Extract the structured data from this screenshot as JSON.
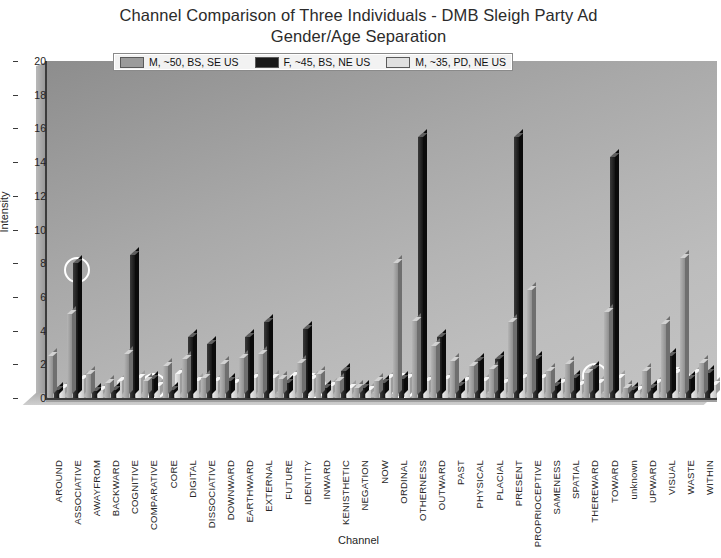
{
  "chart_data": {
    "type": "bar",
    "title": "Channel Comparison of Three Individuals - DMB Sleigh Party Ad Gender/Age Separation",
    "title_lines": [
      "Channel Comparison of Three Individuals - DMB Sleigh Party Ad",
      "Gender/Age Separation"
    ],
    "xlabel": "Channel",
    "ylabel": "Intensity",
    "ylim": [
      0,
      20
    ],
    "yticks": [
      0,
      2,
      4,
      6,
      8,
      10,
      12,
      14,
      16,
      18,
      20
    ],
    "grid": false,
    "legend_position": "top-center",
    "categories": [
      "AROUND",
      "ASSOCIATIVE",
      "AWAYFROM",
      "BACKWARD",
      "COGNITIVE",
      "COMPARATIVE",
      "CORE",
      "DIGITAL",
      "DISSOCIATIVE",
      "DOWNWARD",
      "EARTHWARD",
      "EXTERNAL",
      "FUTURE",
      "IDENTITY",
      "INWARD",
      "KENISTHETIC",
      "NEGATION",
      "NOW",
      "ORDINAL",
      "OTHERNESS",
      "OUTWARD",
      "PAST",
      "PHYSICAL",
      "PLACIAL",
      "PRESENT",
      "PROPRIOCEPTIVE",
      "SAMENESS",
      "SPATIAL",
      "THEREWARD",
      "TOWARD",
      "unknown",
      "UPWARD",
      "VISUAL",
      "WASTE",
      "WITHIN"
    ],
    "series": [
      {
        "name": "M, ~50, BS, SE US",
        "color": "#9b9b9b",
        "values": [
          2.5,
          5.0,
          1.4,
          0.9,
          2.6,
          1.0,
          1.9,
          2.3,
          1.2,
          2.0,
          2.4,
          2.6,
          1.1,
          2.1,
          1.4,
          1.0,
          0.6,
          1.0,
          8.0,
          4.6,
          3.1,
          2.2,
          1.9,
          1.7,
          4.5,
          6.4,
          1.6,
          2.0,
          1.5,
          5.1,
          0.6,
          1.6,
          4.4,
          8.3,
          2.1
        ]
      },
      {
        "name": "F, ~45, BS, NE US",
        "color": "#1a1a1a",
        "values": [
          0.5,
          8.0,
          0.4,
          0.5,
          8.5,
          1.1,
          0.5,
          3.6,
          3.2,
          1.0,
          3.6,
          4.5,
          0.9,
          4.1,
          0.6,
          1.6,
          0.6,
          0.9,
          1.1,
          15.5,
          3.6,
          0.7,
          2.2,
          2.3,
          15.5,
          2.3,
          0.7,
          1.2,
          1.7,
          14.3,
          0.5,
          0.6,
          2.5,
          1.1,
          1.5
        ]
      },
      {
        "name": "M, ~35, PD, NE US",
        "color": "#e0e0e0",
        "values": [
          0.6,
          1.1,
          0.5,
          1.0,
          1.2,
          0.7,
          1.4,
          1.0,
          1.0,
          0.9,
          1.2,
          1.2,
          1.3,
          1.1,
          0.7,
          0.6,
          0.5,
          1.2,
          1.2,
          1.0,
          1.1,
          1.0,
          1.0,
          0.9,
          1.2,
          1.2,
          0.9,
          0.8,
          0.9,
          1.2,
          0.5,
          0.9,
          1.5,
          1.5,
          0.8
        ]
      }
    ],
    "annotations": [
      {
        "type": "circle",
        "target_category": "ASSOCIATIVE",
        "target_series": "F, ~45, BS, NE US",
        "value": 8.0
      },
      {
        "type": "circle",
        "target_category": "COMPARATIVE",
        "target_series": "F, ~45, BS, NE US",
        "value": 1.1
      },
      {
        "type": "circle",
        "target_category": "IDENTITY",
        "target_series": "M, ~35, PD, NE US",
        "value": 1.1
      },
      {
        "type": "circle",
        "target_category": "ORDINAL",
        "target_series": "F, ~45, BS, NE US",
        "value": 1.1
      },
      {
        "type": "circle",
        "target_category": "THEREWARD",
        "target_series": "F, ~45, BS, NE US",
        "value": 1.7
      },
      {
        "type": "circle",
        "target_category": "VISUAL",
        "target_series": "M, ~35, PD, NE US",
        "value": 1.5
      }
    ]
  },
  "legend": {
    "items": [
      {
        "label": "M, ~50, BS, SE US"
      },
      {
        "label": "F, ~45, BS, NE US"
      },
      {
        "label": "M, ~35, PD, NE US"
      }
    ]
  }
}
